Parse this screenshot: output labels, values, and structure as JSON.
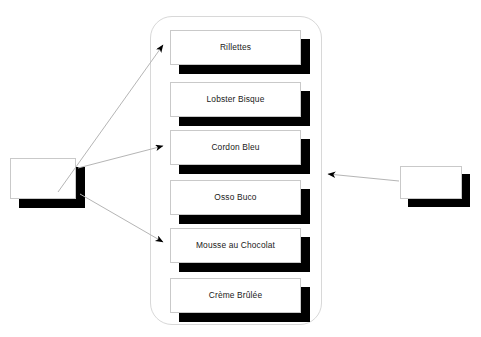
{
  "diagram": {
    "title": "",
    "background_color": "#ffffff",
    "container": {
      "name": "menu-group-container",
      "shape": "rounded-rectangle",
      "border_color": "#d8d8d8",
      "fill_color": "#ffffff"
    },
    "cards": [
      {
        "label": "Rillettes",
        "x": 170,
        "y": 30,
        "shadow_color": "#000000",
        "fill_color": "#ffffff"
      },
      {
        "label": "Lobster Bisque",
        "x": 170,
        "y": 82,
        "shadow_color": "#000000",
        "fill_color": "#ffffff"
      },
      {
        "label": "Cordon Bleu",
        "x": 170,
        "y": 130,
        "shadow_color": "#000000",
        "fill_color": "#ffffff"
      },
      {
        "label": "Osso Buco",
        "x": 170,
        "y": 180,
        "shadow_color": "#000000",
        "fill_color": "#ffffff"
      },
      {
        "label": "Mousse au Chocolat",
        "x": 170,
        "y": 228,
        "shadow_color": "#000000",
        "fill_color": "#ffffff"
      },
      {
        "label": "Crème Brûlée",
        "x": 170,
        "y": 278,
        "shadow_color": "#000000",
        "fill_color": "#ffffff"
      }
    ],
    "side_boxes": [
      {
        "name": "left-actor-box",
        "label": "",
        "x": 10,
        "y": 158,
        "width": 66,
        "height": 41,
        "shadow_color": "#000000",
        "fill_color": "#ffffff"
      },
      {
        "name": "right-actor-box",
        "label": "",
        "x": 400,
        "y": 166,
        "width": 62,
        "height": 33,
        "shadow_color": "#000000",
        "fill_color": "#ffffff"
      }
    ],
    "connectors": [
      {
        "name": "left-to-rillettes",
        "from": "left-actor-box",
        "to": "Rillettes",
        "x1": 58,
        "y1": 192,
        "x2": 163,
        "y2": 45,
        "color": "#b5b5b5"
      },
      {
        "name": "left-to-cordon-bleu",
        "from": "left-actor-box",
        "to": "Cordon Bleu",
        "x1": 78,
        "y1": 168,
        "x2": 163,
        "y2": 146,
        "color": "#b5b5b5"
      },
      {
        "name": "left-to-mousse-au-chocolat",
        "from": "left-actor-box",
        "to": "Mousse au Chocolat",
        "x1": 80,
        "y1": 194,
        "x2": 163,
        "y2": 242,
        "color": "#b5b5b5"
      },
      {
        "name": "right-to-container",
        "from": "right-actor-box",
        "to": "menu-group-container",
        "x1": 399,
        "y1": 181,
        "x2": 326,
        "y2": 174,
        "color": "#b5b5b5"
      }
    ],
    "line_color": "#b5b5b5",
    "arrow_color": "#000000"
  }
}
